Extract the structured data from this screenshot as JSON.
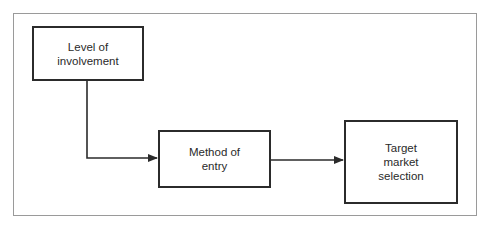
{
  "diagram": {
    "type": "flowchart",
    "nodes": [
      {
        "id": "level",
        "label": "Level of\ninvolvement"
      },
      {
        "id": "method",
        "label": "Method of\nentry"
      },
      {
        "id": "target",
        "label": "Target\nmarket\nselection"
      }
    ],
    "edges": [
      {
        "from": "level",
        "to": "method"
      },
      {
        "from": "method",
        "to": "target"
      }
    ]
  }
}
